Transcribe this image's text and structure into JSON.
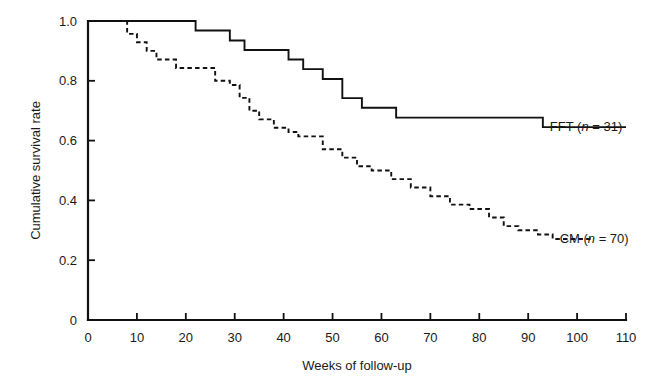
{
  "chart_data": {
    "type": "line",
    "title": "",
    "subtitle": "",
    "xlabel": "Weeks of follow-up",
    "ylabel": "Cumulative survival rate",
    "xlim": [
      0,
      110
    ],
    "ylim": [
      0,
      1.0
    ],
    "xticks": [
      0,
      10,
      20,
      30,
      40,
      50,
      60,
      70,
      80,
      90,
      100,
      110
    ],
    "xtick_labels": [
      "0",
      "10",
      "20",
      "30",
      "40",
      "50",
      "60",
      "70",
      "80",
      "90",
      "100",
      "110"
    ],
    "yticks": [
      0,
      0.2,
      0.4,
      0.6,
      0.8,
      1.0
    ],
    "ytick_labels": [
      "0",
      "0.2",
      "0.4",
      "0.6",
      "0.8",
      "1.0"
    ],
    "grid": false,
    "legend_position": "inline-right-of-curve",
    "step_style": "post",
    "series": [
      {
        "name": "FFT",
        "label_prefix": "FFT (",
        "label_italic": "n",
        "label_suffix": " = 31)",
        "n": 31,
        "line_style": "solid",
        "color": "#111111",
        "label_x": 93,
        "label_y": 0.645,
        "x": [
          0,
          18,
          22,
          25,
          29,
          32,
          38,
          41,
          44,
          48,
          52,
          56,
          63,
          93,
          110
        ],
        "y": [
          1.0,
          1.0,
          0.968,
          0.968,
          0.935,
          0.903,
          0.903,
          0.871,
          0.839,
          0.806,
          0.742,
          0.71,
          0.677,
          0.645,
          0.645
        ]
      },
      {
        "name": "CM",
        "label_prefix": "CM (",
        "label_italic": "n",
        "label_suffix": " = 70)",
        "n": 70,
        "line_style": "dashed",
        "color": "#111111",
        "label_x": 95,
        "label_y": 0.271,
        "x": [
          0,
          6,
          8,
          10,
          12,
          14,
          18,
          23,
          26,
          29,
          31,
          33,
          35,
          38,
          41,
          43,
          45,
          48,
          52,
          55,
          58,
          62,
          66,
          70,
          74,
          78,
          82,
          85,
          88,
          92,
          95,
          103
        ],
        "y": [
          1.0,
          1.0,
          0.957,
          0.929,
          0.9,
          0.871,
          0.843,
          0.843,
          0.8,
          0.786,
          0.743,
          0.7,
          0.671,
          0.643,
          0.629,
          0.614,
          0.614,
          0.571,
          0.543,
          0.514,
          0.5,
          0.471,
          0.443,
          0.414,
          0.386,
          0.371,
          0.343,
          0.314,
          0.3,
          0.286,
          0.271,
          0.271
        ]
      }
    ]
  }
}
